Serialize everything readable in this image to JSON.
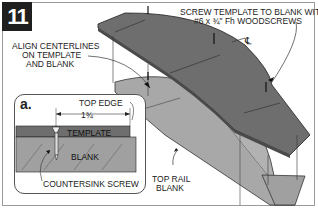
{
  "figure": {
    "step_number": "11",
    "callouts": {
      "screw_note_line1": "SCREW TEMPLATE TO BLANK WITH",
      "screw_note_line2": "#6 x ¾\" Fh WOODSCREWS",
      "centerline_symbol": "℄",
      "align_line1": "ALIGN CENTERLINES",
      "align_line2": "ON TEMPLATE",
      "align_line3": "AND BLANK",
      "top_rail_line1": "TOP RAIL",
      "top_rail_line2": "BLANK"
    },
    "inset": {
      "label": "a.",
      "top_edge": "TOP EDGE",
      "dimension": "1¾",
      "template": "TEMPLATE",
      "blank": "BLANK",
      "countersink": "COUNTERSINK SCREW"
    },
    "colors": {
      "template_dark": "#6e6e6e",
      "blank_light": "#a9a9a9",
      "step_badge": "#1f1f1f"
    }
  }
}
